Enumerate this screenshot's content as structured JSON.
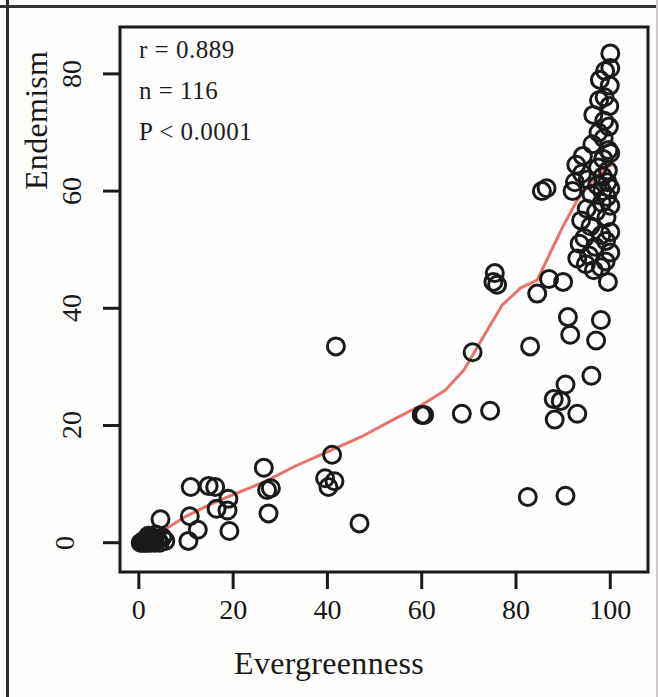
{
  "figure": {
    "background_color": "#fdfdfc",
    "frame_color": "#1a1a1a",
    "point_color": "#1a1a1a",
    "line_color": "#e8726a"
  },
  "annotations": {
    "r": "r = 0.889",
    "n": "n = 116",
    "p": "P < 0.0001"
  },
  "chart_data": {
    "type": "scatter",
    "title": "",
    "subtitle": "",
    "xlabel": "Evergreenness",
    "ylabel": "Endemism",
    "xlim": [
      -4,
      108
    ],
    "ylim": [
      -5,
      88
    ],
    "xticks": [
      0,
      20,
      40,
      60,
      80,
      100
    ],
    "yticks": [
      0,
      20,
      40,
      60,
      80
    ],
    "xtick_labels": [
      "0",
      "20",
      "40",
      "60",
      "80",
      "100"
    ],
    "ytick_labels": [
      "0",
      "20",
      "40",
      "60",
      "80"
    ],
    "grid": false,
    "legend": null,
    "annotations": [
      "r = 0.889",
      "n = 116",
      "P < 0.0001"
    ],
    "marker": "open-circle",
    "marker_color": "#1a1a1a",
    "n_points": 116,
    "points": [
      [
        0.4,
        0.0
      ],
      [
        0.8,
        0.0
      ],
      [
        1.0,
        0.3
      ],
      [
        1.2,
        0.0
      ],
      [
        1.5,
        0.6
      ],
      [
        1.8,
        0.0
      ],
      [
        2.0,
        1.2
      ],
      [
        2.2,
        0.4
      ],
      [
        2.4,
        0.0
      ],
      [
        2.6,
        1.0
      ],
      [
        2.9,
        0.2
      ],
      [
        3.1,
        0.8
      ],
      [
        3.4,
        0.0
      ],
      [
        3.6,
        1.4
      ],
      [
        4.0,
        0.5
      ],
      [
        4.4,
        0.0
      ],
      [
        5.0,
        0.9
      ],
      [
        5.6,
        0.3
      ],
      [
        4.6,
        4.0
      ],
      [
        10.5,
        0.3
      ],
      [
        10.8,
        4.5
      ],
      [
        11.0,
        9.5
      ],
      [
        12.5,
        2.2
      ],
      [
        14.8,
        9.7
      ],
      [
        16.2,
        9.5
      ],
      [
        16.5,
        5.8
      ],
      [
        18.8,
        5.5
      ],
      [
        19.2,
        2.0
      ],
      [
        19.0,
        7.5
      ],
      [
        26.5,
        12.8
      ],
      [
        27.2,
        9.0
      ],
      [
        27.5,
        5.0
      ],
      [
        28.0,
        9.3
      ],
      [
        39.5,
        11.0
      ],
      [
        40.2,
        9.5
      ],
      [
        41.0,
        15.0
      ],
      [
        41.5,
        10.5
      ],
      [
        41.8,
        33.5
      ],
      [
        46.8,
        3.3
      ],
      [
        60.0,
        21.8
      ],
      [
        60.5,
        21.8
      ],
      [
        68.5,
        22.0
      ],
      [
        70.8,
        32.5
      ],
      [
        74.5,
        22.5
      ],
      [
        75.2,
        44.5
      ],
      [
        75.5,
        46.0
      ],
      [
        76.0,
        44.0
      ],
      [
        82.5,
        7.8
      ],
      [
        83.0,
        33.5
      ],
      [
        84.5,
        42.5
      ],
      [
        86.5,
        60.5
      ],
      [
        88.0,
        24.5
      ],
      [
        88.2,
        21.0
      ],
      [
        89.5,
        24.2
      ],
      [
        90.0,
        44.5
      ],
      [
        90.5,
        27.0
      ],
      [
        91.0,
        38.5
      ],
      [
        91.5,
        35.5
      ],
      [
        92.0,
        60.0
      ],
      [
        92.5,
        61.5
      ],
      [
        92.8,
        64.5
      ],
      [
        93.0,
        48.5
      ],
      [
        93.5,
        51.0
      ],
      [
        93.8,
        55.0
      ],
      [
        94.0,
        63.0
      ],
      [
        94.2,
        66.0
      ],
      [
        94.5,
        52.0
      ],
      [
        94.8,
        47.5
      ],
      [
        95.0,
        57.0
      ],
      [
        95.2,
        62.0
      ],
      [
        95.5,
        49.0
      ],
      [
        95.8,
        54.0
      ],
      [
        96.0,
        59.5
      ],
      [
        96.2,
        68.0
      ],
      [
        96.4,
        73.0
      ],
      [
        96.5,
        46.5
      ],
      [
        96.8,
        50.5
      ],
      [
        97.0,
        56.5
      ],
      [
        97.2,
        61.0
      ],
      [
        97.4,
        64.0
      ],
      [
        97.5,
        70.0
      ],
      [
        97.6,
        75.5
      ],
      [
        97.8,
        79.0
      ],
      [
        98.0,
        47.0
      ],
      [
        98.1,
        52.5
      ],
      [
        98.2,
        58.0
      ],
      [
        98.3,
        60.0
      ],
      [
        98.4,
        62.5
      ],
      [
        98.5,
        65.5
      ],
      [
        98.6,
        69.0
      ],
      [
        98.7,
        72.0
      ],
      [
        98.8,
        76.0
      ],
      [
        98.9,
        80.5
      ],
      [
        99.0,
        48.0
      ],
      [
        99.1,
        51.5
      ],
      [
        99.2,
        55.5
      ],
      [
        99.3,
        59.0
      ],
      [
        99.4,
        61.5
      ],
      [
        99.5,
        63.5
      ],
      [
        99.6,
        67.0
      ],
      [
        99.7,
        71.0
      ],
      [
        99.8,
        74.5
      ],
      [
        99.9,
        78.0
      ],
      [
        100.0,
        81.0
      ],
      [
        100.0,
        49.5
      ],
      [
        100.0,
        53.0
      ],
      [
        100.0,
        57.5
      ],
      [
        100.0,
        60.5
      ],
      [
        100.0,
        66.5
      ],
      [
        100.0,
        83.5
      ],
      [
        99.5,
        44.5
      ],
      [
        98.0,
        38.0
      ],
      [
        97.0,
        34.5
      ],
      [
        96.0,
        28.5
      ],
      [
        93.0,
        22.0
      ],
      [
        90.5,
        8.0
      ],
      [
        87.0,
        45.0
      ],
      [
        85.5,
        60.0
      ]
    ],
    "trend_line": {
      "name": "lowess-fit",
      "color": "#e8726a",
      "points": [
        [
          1.0,
          0.0
        ],
        [
          5.0,
          2.0
        ],
        [
          10.0,
          4.5
        ],
        [
          15.0,
          6.5
        ],
        [
          20.0,
          8.2
        ],
        [
          27.0,
          10.5
        ],
        [
          33.0,
          13.0
        ],
        [
          40.0,
          15.5
        ],
        [
          47.0,
          18.0
        ],
        [
          54.0,
          21.0
        ],
        [
          60.0,
          23.5
        ],
        [
          65.0,
          26.0
        ],
        [
          69.0,
          29.5
        ],
        [
          73.0,
          35.0
        ],
        [
          77.0,
          40.5
        ],
        [
          81.0,
          43.5
        ],
        [
          84.5,
          44.8
        ],
        [
          87.0,
          49.0
        ],
        [
          90.0,
          54.0
        ],
        [
          93.0,
          58.5
        ],
        [
          96.0,
          61.5
        ],
        [
          99.0,
          64.0
        ],
        [
          100.5,
          64.5
        ]
      ]
    }
  }
}
